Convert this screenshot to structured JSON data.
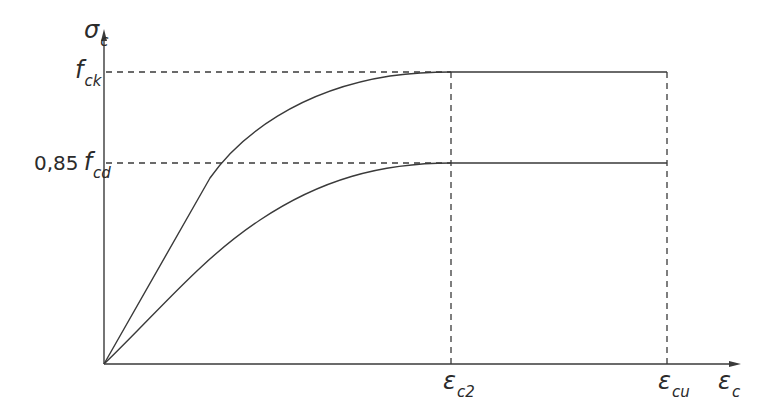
{
  "diagram": {
    "type": "stress-strain diagram (concrete)",
    "colors": {
      "line": "#3a3a3a",
      "dashed": "#3a3a3a",
      "background": "#ffffff"
    },
    "axes": {
      "y_label": {
        "symbol": "σ",
        "subscript": "c"
      },
      "x_label": {
        "symbol": "ε",
        "subscript": "c"
      }
    },
    "y_levels": [
      {
        "id": "fck",
        "prefix": "",
        "symbol": "f",
        "subscript": "ck"
      },
      {
        "id": "fcd",
        "prefix": "0,85",
        "symbol": "f",
        "subscript": "cd"
      }
    ],
    "x_marks": [
      {
        "id": "ec2",
        "symbol": "ε",
        "subscript": "c2"
      },
      {
        "id": "ecu",
        "symbol": "ε",
        "subscript": "cu"
      }
    ],
    "curves": [
      {
        "name": "characteristic curve",
        "peak_level": "fck",
        "description": "parabola from origin to (εc2, fck), then constant to εcu"
      },
      {
        "name": "design curve",
        "peak_level": "0,85 fcd",
        "description": "parabola from origin to (εc2, 0.85 fcd), then constant to εcu"
      }
    ]
  }
}
